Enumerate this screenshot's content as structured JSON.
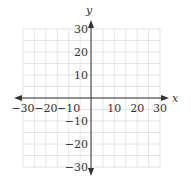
{
  "chart_data": {
    "type": "scatter",
    "title": "",
    "xlabel": "x",
    "ylabel": "y",
    "xlim": [
      -30,
      30
    ],
    "ylim": [
      -30,
      30
    ],
    "grid": true,
    "grid_step": 5,
    "x_ticks": [
      -30,
      -20,
      -10,
      10,
      20,
      30
    ],
    "y_ticks": [
      30,
      20,
      10,
      -10,
      -20,
      -30
    ],
    "x_tick_labels": [
      "−30",
      "−20",
      "−10",
      "10",
      "20",
      "30"
    ],
    "y_tick_labels": [
      "30",
      "20",
      "10",
      "−10",
      "−20",
      "−30"
    ],
    "series": [],
    "legend": null
  },
  "colors": {
    "grid": "#dddddd",
    "axis": "#333333",
    "text": "#333333"
  }
}
